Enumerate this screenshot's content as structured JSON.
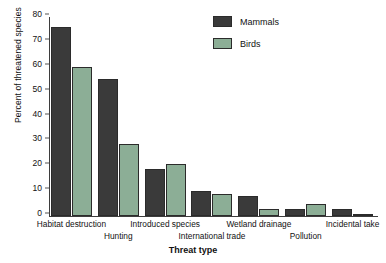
{
  "chart_data": {
    "type": "bar",
    "title": "",
    "xlabel": "Threat type",
    "ylabel": "Percent of threatened species",
    "ylim": [
      0,
      80
    ],
    "yticks": [
      0,
      10,
      20,
      30,
      40,
      50,
      60,
      70,
      80
    ],
    "grid": false,
    "legend_position": "top-right",
    "categories": [
      "Habitat destruction",
      "Hunting",
      "Introduced species",
      "International trade",
      "Wetland drainage",
      "Pollution",
      "Incidental take"
    ],
    "category_rows": [
      0,
      1,
      0,
      1,
      0,
      1,
      0
    ],
    "series": [
      {
        "name": "Mammals",
        "color": "#3a3a3a",
        "values": [
          76,
          55,
          19,
          10,
          8,
          3,
          3
        ]
      },
      {
        "name": "Birds",
        "color": "#8cae96",
        "values": [
          60,
          29,
          21,
          9,
          3,
          5,
          1
        ]
      }
    ]
  },
  "legend": {
    "items": [
      {
        "label": "Mammals"
      },
      {
        "label": "Birds"
      }
    ]
  }
}
